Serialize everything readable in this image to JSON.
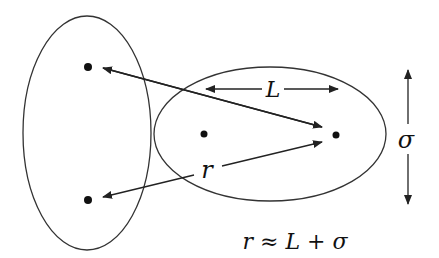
{
  "diagram": {
    "labels": {
      "length": "L",
      "distance": "r",
      "width": "σ"
    },
    "formula": "r ≈ L + σ",
    "colors": {
      "stroke": "#222222",
      "background": "#ffffff"
    }
  }
}
